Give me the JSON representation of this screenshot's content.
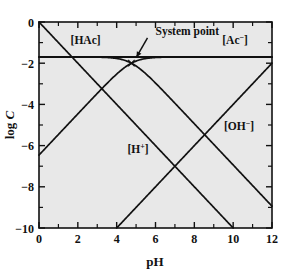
{
  "chart_data": {
    "type": "line",
    "title": "",
    "subtitle": "",
    "xlabel": "pH",
    "ylabel": "log C",
    "xlim": [
      0,
      12
    ],
    "ylim": [
      -10,
      0
    ],
    "grid": false,
    "legend_position": "inline-labels",
    "x_ticks_major": [
      0,
      2,
      4,
      6,
      8,
      10,
      12
    ],
    "x_ticks_minor": [
      1,
      3,
      5,
      7,
      9,
      11
    ],
    "x_tick_labels": [
      "0",
      "2",
      "4",
      "6",
      "8",
      "10",
      "12"
    ],
    "y_ticks_major": [
      0,
      -2,
      -4,
      -6,
      -8,
      -10
    ],
    "y_ticks_minor": [
      -1,
      -3,
      -5,
      -7,
      -9
    ],
    "y_tick_labels": [
      "0",
      "−2",
      "−4",
      "−6",
      "−8",
      "−10"
    ],
    "system_parameters": {
      "CT_log": -1.7,
      "pKa": 4.76,
      "pKw": 14
    },
    "series": [
      {
        "name": "CT",
        "label": "",
        "description": "total acetate concentration horizontal line",
        "x": [
          0,
          12
        ],
        "values": [
          -1.7,
          -1.7
        ]
      },
      {
        "name": "HAc",
        "label": "[HAc]",
        "label_text": "[HAc]",
        "label_x": 2.4,
        "label_y": -1.05,
        "x": [
          0,
          1,
          2,
          3,
          4,
          4.76,
          5,
          6,
          7,
          8,
          9,
          10,
          11,
          12
        ],
        "values": [
          -1.7,
          -1.7,
          -1.71,
          -1.77,
          -1.97,
          -2.3,
          -2.44,
          -3.2,
          -4.1,
          -5.05,
          -6.04,
          -7.04,
          -8.04,
          -9.04
        ]
      },
      {
        "name": "Ac",
        "label": "[Ac⁻]",
        "label_text": "[Ac−]",
        "label_x": 10.1,
        "label_y": -1.05,
        "x": [
          0,
          1,
          2,
          3,
          4,
          4.76,
          5,
          6,
          7,
          8,
          9,
          10,
          11,
          12
        ],
        "values": [
          -6.46,
          -5.46,
          -4.47,
          -3.5,
          -2.6,
          -2.3,
          -2.11,
          -1.79,
          -1.72,
          -1.7,
          -1.7,
          -1.7,
          -1.7,
          -1.7
        ]
      },
      {
        "name": "H",
        "label": "[H⁺]",
        "label_text": "[H+]",
        "label_x": 5.1,
        "label_y": -6.35,
        "x": [
          0,
          10
        ],
        "values": [
          0,
          -10
        ]
      },
      {
        "name": "OH",
        "label": "[OH⁻]",
        "label_text": "[OH−]",
        "label_x": 10.3,
        "label_y": -5.25,
        "x": [
          4,
          12
        ],
        "values": [
          -10,
          -2
        ]
      }
    ],
    "annotations": [
      {
        "name": "system-point",
        "text": "System point",
        "marker": "×",
        "point_x": 4.76,
        "point_y": -2.0,
        "text_x": 6.0,
        "text_y": -0.62
      }
    ],
    "colors": {
      "plot_background": "#e8e8e8",
      "figure_background": "#ffffff",
      "curve": "#111111",
      "axis": "#111111",
      "text": "#111111"
    }
  }
}
